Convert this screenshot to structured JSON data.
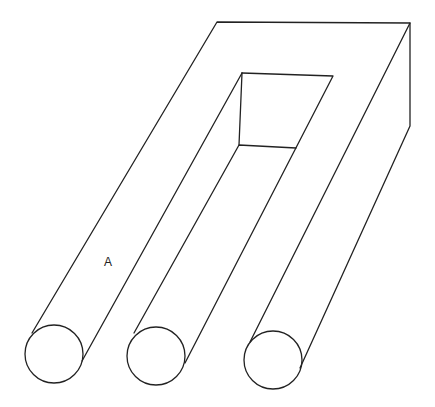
{
  "figure": {
    "labels": [
      {
        "text": "A",
        "x": 104,
        "y": 255
      }
    ],
    "line_color": "#222222",
    "background": "#ffffff",
    "prongs": [
      {
        "name": "left",
        "cx": 54,
        "cy": 354,
        "r": 29
      },
      {
        "name": "middle",
        "cx": 156,
        "cy": 356,
        "r": 29
      },
      {
        "name": "right",
        "cx": 273,
        "cy": 360,
        "r": 29
      }
    ]
  }
}
